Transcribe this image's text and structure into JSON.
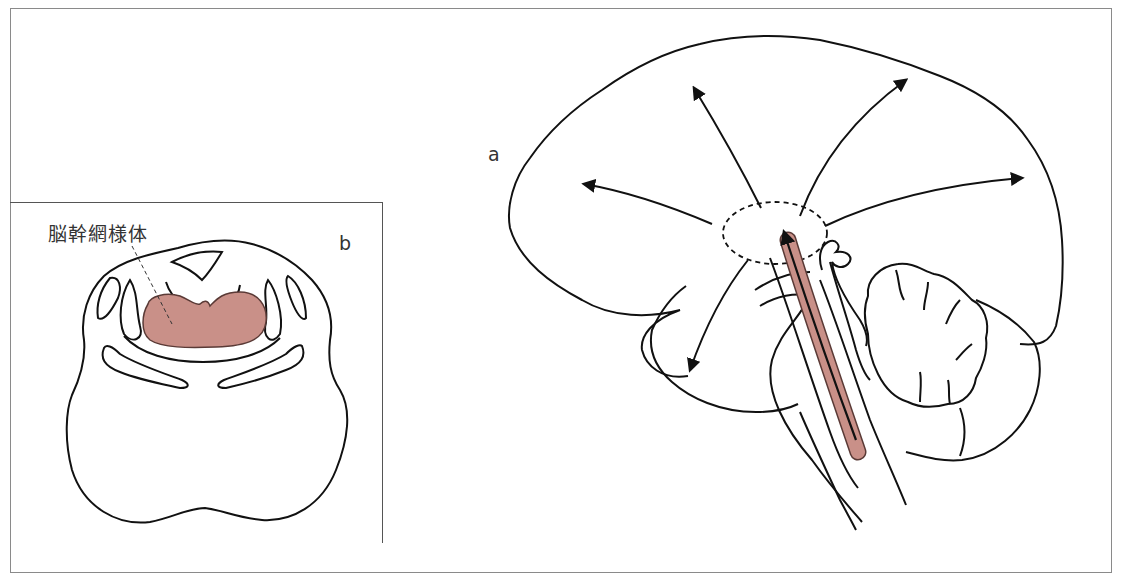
{
  "figure": {
    "panel_a": {
      "label": "a",
      "view": "sagittal-brain",
      "description_elements": [
        "cerebrum",
        "cerebellum",
        "brainstem",
        "thalamus-region-dashed",
        "reticular-formation-band",
        "projection-arrows"
      ]
    },
    "panel_b": {
      "label": "b",
      "view": "pons-cross-section",
      "annotation": "脳幹網様体"
    },
    "colors": {
      "outline": "#111111",
      "reticular_fill": "#c99088",
      "reticular_stroke": "#5a3a36",
      "frame": "#8a8a8a",
      "label_text": "#333333"
    },
    "arrows": {
      "count": 6,
      "directions": [
        "anterior",
        "anterior-superior",
        "superior-posterior",
        "posterior",
        "inferior-anterior",
        "ascending-brainstem"
      ]
    }
  }
}
